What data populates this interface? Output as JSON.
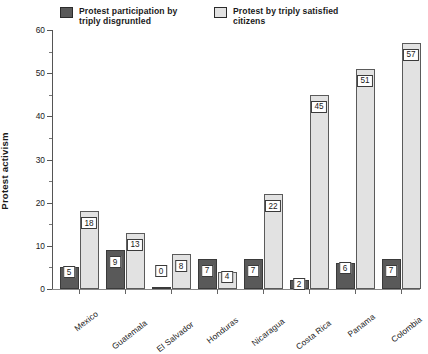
{
  "chart_data": {
    "type": "bar",
    "title": "",
    "xlabel": "",
    "ylabel": "Protest activism",
    "ylim": [
      0,
      60
    ],
    "yticks": [
      0,
      10,
      20,
      30,
      40,
      50,
      60
    ],
    "yminorticks": [
      5,
      15,
      25,
      35,
      45,
      55
    ],
    "grid": false,
    "legend_position": "top",
    "grouping": "grouped",
    "categories": [
      "Mexico",
      "Guatemala",
      "El Salvador",
      "Honduras",
      "Nicaragua",
      "Costa Rica",
      "Panama",
      "Colombia"
    ],
    "series": [
      {
        "name": "Protest participation by\ntriply disgruntled",
        "color": "#595959",
        "values": [
          5,
          9,
          0,
          7,
          7,
          2,
          6,
          7
        ],
        "labels": [
          "5",
          "9",
          "0",
          "7",
          "7",
          "2",
          "6",
          "7"
        ]
      },
      {
        "name": "Protest by triply satisfied\ncitizens",
        "color": "#e2e2e2",
        "values": [
          18,
          13,
          8,
          4,
          22,
          45,
          51,
          57
        ],
        "labels": [
          "18",
          "13",
          "8",
          "4",
          "22",
          "45",
          "51",
          "57"
        ]
      }
    ]
  },
  "legend": {
    "entries": [
      {
        "label": "Protest participation by\ntriply disgruntled",
        "swatch": "dark"
      },
      {
        "label": "Protest by triply satisfied\ncitizens",
        "swatch": "light"
      }
    ]
  },
  "axes": {
    "y_title": "Protest activism",
    "y_tick_labels": [
      "0",
      "10",
      "20",
      "30",
      "40",
      "50",
      "60"
    ]
  }
}
